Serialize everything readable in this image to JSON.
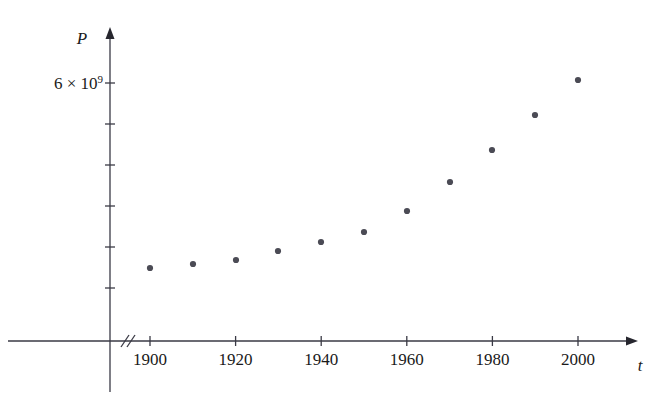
{
  "chart_data": {
    "type": "scatter",
    "title": "",
    "subtitle": "",
    "xlabel": "t",
    "ylabel": "P",
    "x": [
      1900,
      1910,
      1920,
      1930,
      1940,
      1950,
      1960,
      1970,
      1980,
      1990,
      2000
    ],
    "values": [
      1650000000.0,
      1750000000.0,
      1860000000.0,
      2070000000.0,
      2300000000.0,
      2520000000.0,
      3020000000.0,
      3700000000.0,
      4450000000.0,
      5280000000.0,
      6080000000.0
    ],
    "xtick_labels": [
      "1900",
      "1920",
      "1940",
      "1960",
      "1980",
      "2000"
    ],
    "xtick_values": [
      1900,
      1920,
      1940,
      1960,
      1980,
      2000
    ],
    "ytick_labels": [
      "6 × 10⁹",
      "",
      "",
      "",
      "",
      ""
    ],
    "ytick_values": [
      6000000000.0,
      5000000000.0,
      4000000000.0,
      3000000000.0,
      2000000000.0,
      1000000000.0
    ],
    "ylabel_mantissa": "6 × 10",
    "ylabel_exponent": "9",
    "xlim": [
      1890,
      2010
    ],
    "ylim": [
      0,
      7000000000.0
    ],
    "grid": false,
    "legend": null,
    "axis_break_x": true,
    "marker": "dot",
    "marker_color": "#4b4b55",
    "axis_color": "#3a3a45",
    "background_color": "#ffffff",
    "annotations": []
  },
  "geometry": {
    "y_axis_x": 110,
    "x_axis_y": 341,
    "y_axis_top": 27,
    "x_axis_right": 638,
    "decade_px": 42.8,
    "x_1900_px": 150,
    "y_tick_px": [
      83,
      124,
      165,
      206,
      247,
      288
    ],
    "points_px": [
      {
        "cx": 150,
        "cy": 268
      },
      {
        "cx": 193,
        "cy": 264
      },
      {
        "cx": 236,
        "cy": 260
      },
      {
        "cx": 278,
        "cy": 251
      },
      {
        "cx": 321,
        "cy": 242
      },
      {
        "cx": 364,
        "cy": 232
      },
      {
        "cx": 407,
        "cy": 211
      },
      {
        "cx": 450,
        "cy": 182
      },
      {
        "cx": 492,
        "cy": 150
      },
      {
        "cx": 535,
        "cy": 115
      },
      {
        "cx": 578,
        "cy": 80
      }
    ],
    "break_slashes": [
      {
        "x1": 121,
        "y1": 347,
        "x2": 129,
        "y2": 335
      },
      {
        "x1": 127,
        "y1": 347,
        "x2": 135,
        "y2": 335
      }
    ],
    "dot_radius": 3.1
  }
}
